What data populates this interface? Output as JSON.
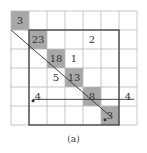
{
  "figure": {
    "caption": "(a)",
    "grid": {
      "cols": 7,
      "rows": 6,
      "left": 11,
      "top": 11,
      "cell_w": 18,
      "cell_h": 19
    },
    "inner_box": {
      "col_start": 1,
      "col_end": 6,
      "row_start": 1,
      "row_end": 6
    },
    "colors": {
      "shade": "#a8a8a8",
      "grid": "#b8b8b8",
      "bold": "#333333",
      "text": "#333333"
    },
    "cells": [
      {
        "row": 0,
        "col": 0,
        "label": "3",
        "shaded": true
      },
      {
        "row": 1,
        "col": 1,
        "label": "23",
        "shaded": true
      },
      {
        "row": 1,
        "col": 4,
        "label": "2",
        "shaded": false
      },
      {
        "row": 2,
        "col": 2,
        "label": "18",
        "shaded": true
      },
      {
        "row": 2,
        "col": 3,
        "label": "1",
        "shaded": false
      },
      {
        "row": 3,
        "col": 2,
        "label": "5",
        "shaded": false
      },
      {
        "row": 3,
        "col": 3,
        "label": "13",
        "shaded": true
      },
      {
        "row": 4,
        "col": 1,
        "label": "4",
        "shaded": false
      },
      {
        "row": 4,
        "col": 4,
        "label": "8",
        "shaded": true
      },
      {
        "row": 4,
        "col": 6,
        "label": "4",
        "shaded": false
      },
      {
        "row": 5,
        "col": 5,
        "label": "3",
        "shaded": true
      }
    ],
    "dots": [
      {
        "row": 4,
        "col": 1
      },
      {
        "row": 5,
        "col": 5
      }
    ]
  }
}
